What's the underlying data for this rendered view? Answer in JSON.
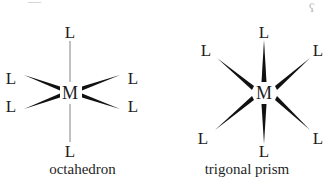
{
  "figure": {
    "background_color": "#ffffff",
    "ink_color": "#1c1c1c",
    "thin_bond_color": "#8e8e8e",
    "artifacts": {
      "top_left": "—",
      "top_right": "ʕ"
    }
  },
  "panels": [
    {
      "id": "octahedron",
      "caption": "octahedron",
      "center_label": "M",
      "center": {
        "x": 70,
        "y": 93
      },
      "ligand_label": "L",
      "ligands": [
        {
          "name": "ligand-top",
          "label": "L",
          "x": 70,
          "y": 32,
          "bond": "line"
        },
        {
          "name": "ligand-bottom",
          "label": "L",
          "x": 70,
          "y": 151,
          "bond": "line"
        },
        {
          "name": "ligand-upper-left",
          "label": "L",
          "x": 11,
          "y": 78,
          "bond": "wedge"
        },
        {
          "name": "ligand-lower-left",
          "label": "L",
          "x": 11,
          "y": 106,
          "bond": "wedge"
        },
        {
          "name": "ligand-upper-right",
          "label": "L",
          "x": 133,
          "y": 78,
          "bond": "wedge"
        },
        {
          "name": "ligand-lower-right",
          "label": "L",
          "x": 133,
          "y": 106,
          "bond": "wedge"
        }
      ]
    },
    {
      "id": "trigonal-prism",
      "caption": "trigonal prism",
      "center_label": "M",
      "center": {
        "x": 99,
        "y": 93
      },
      "ligand_label": "L",
      "ligands": [
        {
          "name": "ligand-top",
          "label": "L",
          "x": 99,
          "y": 32,
          "bond": "wedge"
        },
        {
          "name": "ligand-bottom",
          "label": "L",
          "x": 99,
          "y": 151,
          "bond": "wedge"
        },
        {
          "name": "ligand-upper-left",
          "label": "L",
          "x": 41,
          "y": 50,
          "bond": "wedge"
        },
        {
          "name": "ligand-lower-left",
          "label": "L",
          "x": 38,
          "y": 138,
          "bond": "wedge"
        },
        {
          "name": "ligand-upper-right",
          "label": "L",
          "x": 153,
          "y": 50,
          "bond": "wedge"
        },
        {
          "name": "ligand-lower-right",
          "label": "L",
          "x": 153,
          "y": 138,
          "bond": "wedge"
        }
      ]
    }
  ]
}
